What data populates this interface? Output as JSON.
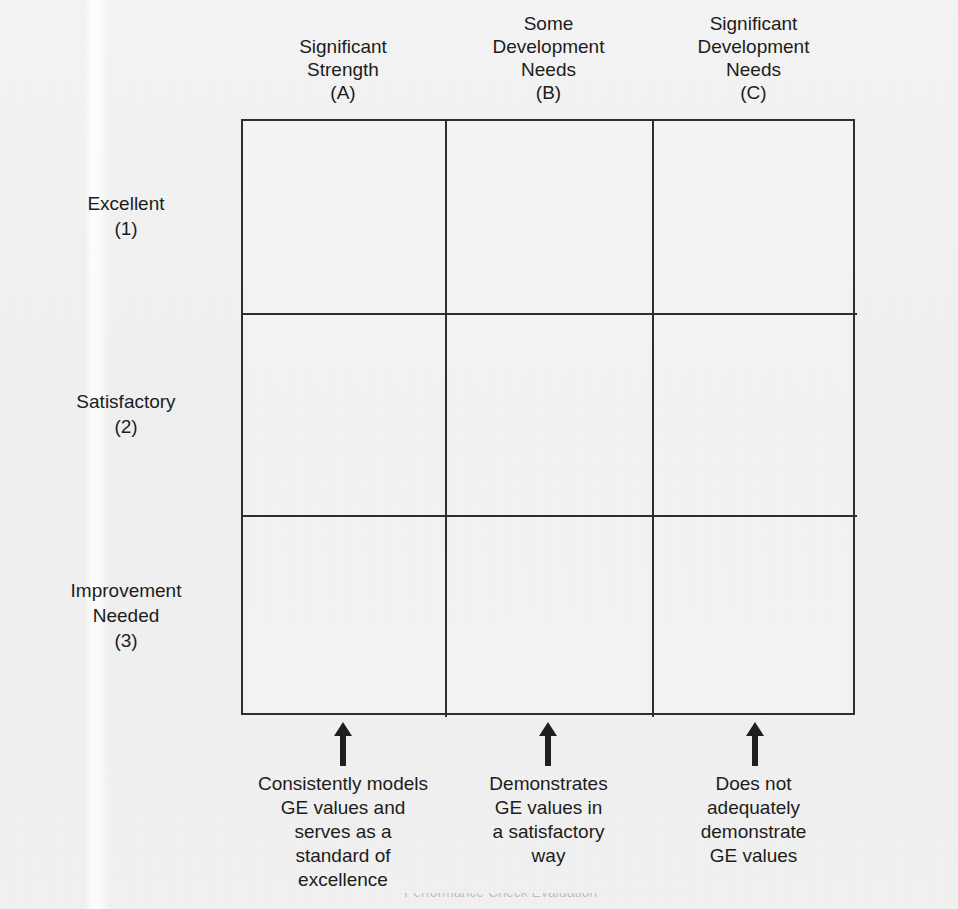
{
  "matrix": {
    "column_headers": [
      {
        "id": "a",
        "label": "Significant\nStrength\n(A)"
      },
      {
        "id": "b",
        "label": "Some\nDevelopment\nNeeds\n(B)"
      },
      {
        "id": "c",
        "label": "Significant\nDevelopment\nNeeds\n(C)"
      }
    ],
    "row_labels": [
      {
        "id": "1",
        "label": "Excellent\n(1)"
      },
      {
        "id": "2",
        "label": "Satisfactory\n(2)"
      },
      {
        "id": "3",
        "label": "Improvement\nNeeded\n(3)"
      }
    ],
    "cells": [
      [
        "",
        "",
        ""
      ],
      [
        "",
        "",
        ""
      ],
      [
        "",
        "",
        ""
      ]
    ],
    "column_captions": [
      {
        "id": "a",
        "text": "Consistently models\nGE values and\nserves as a\nstandard of\nexcellence"
      },
      {
        "id": "b",
        "text": "Demonstrates\nGE values in\na satisfactory\nway"
      },
      {
        "id": "c",
        "text": "Does not\nadequately\ndemonstrate\nGE values"
      }
    ],
    "arrows": [
      {
        "id": "a",
        "direction": "up"
      },
      {
        "id": "b",
        "direction": "up"
      },
      {
        "id": "c",
        "direction": "up"
      }
    ]
  },
  "footer": {
    "cut_off_line": "Performance Check Evaluation - - - - - - - - - - -"
  },
  "colors": {
    "page_background": "#f1f1f1",
    "grid_line": "#2e2e2e",
    "text": "#1c1c1c",
    "arrow": "#1f1f1f"
  }
}
